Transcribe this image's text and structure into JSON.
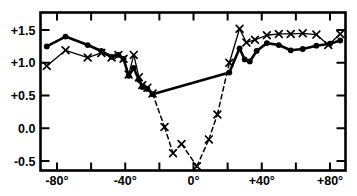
{
  "chart_data": {
    "type": "line",
    "title": "",
    "subtitle": "",
    "xlabel": "",
    "ylabel": "",
    "xlim": [
      -90,
      90
    ],
    "ylim": [
      -0.72,
      1.7
    ],
    "grid": false,
    "legend": null,
    "frame": "full-box",
    "tick_direction": "inward",
    "x_ticks_major": [
      -80,
      -40,
      0,
      40,
      80
    ],
    "x_ticks_minor": [
      -60,
      -20,
      20,
      60
    ],
    "x_tick_labels": [
      "-80°",
      "-40°",
      "0°",
      "+40°",
      "+80°"
    ],
    "y_ticks": [
      -0.5,
      0.0,
      0.5,
      1.0,
      1.5
    ],
    "y_tick_labels": [
      "-0.5",
      "0.0",
      "+0.5",
      "+1.0",
      "+1.5"
    ],
    "series": [
      {
        "name": "filled-circle-series",
        "marker": "filled-circle",
        "linestyle": "solid",
        "linewidth": 2.6,
        "color": "#000000",
        "points": [
          {
            "x": -86,
            "y": 1.25
          },
          {
            "x": -75,
            "y": 1.4
          },
          {
            "x": -62,
            "y": 1.27
          },
          {
            "x": -54,
            "y": 1.18
          },
          {
            "x": -48,
            "y": 1.09
          },
          {
            "x": -44,
            "y": 1.12
          },
          {
            "x": -41,
            "y": 1.06
          },
          {
            "x": -38,
            "y": 0.8
          },
          {
            "x": -35,
            "y": 0.92
          },
          {
            "x": -32,
            "y": 0.74
          },
          {
            "x": -30,
            "y": 0.63
          },
          {
            "x": -27,
            "y": 0.6
          },
          {
            "x": -24,
            "y": 0.52
          },
          {
            "x": 21,
            "y": 0.85
          },
          {
            "x": 27,
            "y": 1.22
          },
          {
            "x": 30,
            "y": 1.05
          },
          {
            "x": 33,
            "y": 1.02
          },
          {
            "x": 37,
            "y": 1.18
          },
          {
            "x": 43,
            "y": 1.3
          },
          {
            "x": 50,
            "y": 1.27
          },
          {
            "x": 57,
            "y": 1.19
          },
          {
            "x": 64,
            "y": 1.21
          },
          {
            "x": 72,
            "y": 1.26
          },
          {
            "x": 80,
            "y": 1.29
          },
          {
            "x": 86,
            "y": 1.34
          }
        ]
      },
      {
        "name": "cross-marker-series",
        "marker": "x-cross",
        "linestyle": "solid-with-dashed-center",
        "linewidth": 1.3,
        "color": "#000000",
        "dashed_x_range": [
          -24,
          21
        ],
        "points": [
          {
            "x": -86,
            "y": 0.95
          },
          {
            "x": -75,
            "y": 1.19
          },
          {
            "x": -62,
            "y": 1.08
          },
          {
            "x": -54,
            "y": 1.15
          },
          {
            "x": -48,
            "y": 1.08
          },
          {
            "x": -44,
            "y": 1.12
          },
          {
            "x": -41,
            "y": 1.06
          },
          {
            "x": -38,
            "y": 0.82
          },
          {
            "x": -35,
            "y": 1.12
          },
          {
            "x": -32,
            "y": 0.78
          },
          {
            "x": -30,
            "y": 0.66
          },
          {
            "x": -27,
            "y": 0.62
          },
          {
            "x": -24,
            "y": 0.53
          },
          {
            "x": -17,
            "y": 0.02
          },
          {
            "x": -12,
            "y": -0.38
          },
          {
            "x": -7,
            "y": -0.24
          },
          {
            "x": 2,
            "y": -0.58
          },
          {
            "x": 9,
            "y": -0.17
          },
          {
            "x": 14,
            "y": 0.21
          },
          {
            "x": 21,
            "y": 1.0
          },
          {
            "x": 27,
            "y": 1.52
          },
          {
            "x": 31,
            "y": 1.31
          },
          {
            "x": 36,
            "y": 1.35
          },
          {
            "x": 43,
            "y": 1.42
          },
          {
            "x": 50,
            "y": 1.44
          },
          {
            "x": 57,
            "y": 1.44
          },
          {
            "x": 64,
            "y": 1.45
          },
          {
            "x": 72,
            "y": 1.43
          },
          {
            "x": 79,
            "y": 1.27
          },
          {
            "x": 86,
            "y": 1.44
          }
        ]
      }
    ]
  }
}
